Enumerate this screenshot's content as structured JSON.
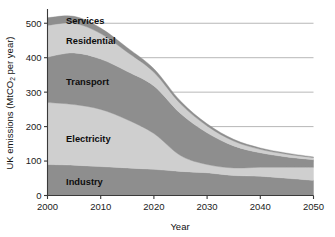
{
  "chart_data": {
    "type": "area",
    "stacked": true,
    "title": "",
    "xlabel": "Year",
    "ylabel": "UK emissions (MtCO2 per year)",
    "ylabel_parts": {
      "pre": "UK emissions (MtCO",
      "sub": "2",
      "post": " per year)"
    },
    "x": [
      2000,
      2005,
      2010,
      2015,
      2020,
      2025,
      2030,
      2035,
      2040,
      2045,
      2050
    ],
    "xlim": [
      2000,
      2050
    ],
    "ylim": [
      0,
      530
    ],
    "xticks": [
      2000,
      2010,
      2020,
      2030,
      2040,
      2050
    ],
    "yticks": [
      0,
      100,
      200,
      300,
      400,
      500
    ],
    "grid": "horizontal",
    "legend": "inline-band-labels",
    "series": [
      {
        "name": "Industry",
        "color": "#8e8e8e",
        "values": [
          90,
          88,
          84,
          80,
          76,
          70,
          66,
          58,
          56,
          50,
          44
        ]
      },
      {
        "name": "Electricity",
        "color": "#cfcfcf",
        "values": [
          180,
          176,
          166,
          140,
          104,
          46,
          24,
          22,
          26,
          32,
          38
        ]
      },
      {
        "name": "Transport",
        "color": "#8e8e8e",
        "values": [
          132,
          150,
          146,
          140,
          138,
          122,
          92,
          64,
          42,
          30,
          22
        ]
      },
      {
        "name": "Residential",
        "color": "#cfcfcf",
        "values": [
          92,
          86,
          74,
          56,
          40,
          28,
          20,
          14,
          10,
          8,
          6
        ]
      },
      {
        "name": "Services",
        "color": "#8e8e8e",
        "values": [
          22,
          20,
          16,
          13,
          10,
          8,
          6,
          5,
          4,
          3,
          2
        ]
      }
    ],
    "totals": [
      516,
      520,
      486,
      429,
      368,
      274,
      208,
      163,
      138,
      123,
      112
    ],
    "band_labels": [
      {
        "name": "Services",
        "x": 2003.5,
        "y": 508
      },
      {
        "name": "Residential",
        "x": 2003.5,
        "y": 448
      },
      {
        "name": "Transport",
        "x": 2003.5,
        "y": 330
      },
      {
        "name": "Electricity",
        "x": 2003.5,
        "y": 165
      },
      {
        "name": "Industry",
        "x": 2003.5,
        "y": 40
      }
    ]
  },
  "axis": {
    "x_tick_labels": [
      "2000",
      "2010",
      "2020",
      "2030",
      "2040",
      "2050"
    ],
    "y_tick_labels": [
      "0",
      "100",
      "200",
      "300",
      "400",
      "500"
    ],
    "x_title": "Year"
  },
  "colors": {
    "dark_band": "#8e8e8e",
    "light_band": "#cfcfcf",
    "gridline": "#9a9a9a",
    "axis": "#3a3a3a",
    "text": "#111111",
    "background": "#ffffff"
  }
}
